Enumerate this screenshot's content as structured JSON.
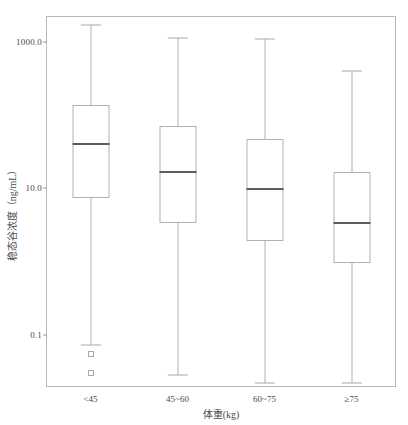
{
  "chart_data": {
    "type": "box",
    "title": "",
    "xlabel": "体重(kg)",
    "ylabel": "稳态谷浓度（ng/mL）",
    "y_scale": "log",
    "ylim": [
      0.02,
      2200
    ],
    "yticks": [
      0.1,
      10.0,
      1000.0
    ],
    "ytick_labels": [
      "0.1",
      "10.0",
      "1000.0"
    ],
    "grid": false,
    "legend": "none",
    "categories": [
      "<45",
      "45~60",
      "60~75",
      "≥75"
    ],
    "boxes": [
      {
        "category": "<45",
        "whisker_low": 0.073,
        "q1": 7.4,
        "median": 40.0,
        "q3": 140.0,
        "whisker_high": 1700.0,
        "outliers": [
          0.055,
          0.03
        ]
      },
      {
        "category": "45~60",
        "whisker_low": 0.028,
        "q1": 3.4,
        "median": 17.0,
        "q3": 72.0,
        "whisker_high": 1140.0,
        "outliers": []
      },
      {
        "category": "60~75",
        "whisker_low": 0.022,
        "q1": 1.9,
        "median": 9.7,
        "q3": 48.0,
        "whisker_high": 1090.0,
        "outliers": []
      },
      {
        "category": "≥75",
        "whisker_low": 0.022,
        "q1": 0.95,
        "median": 3.4,
        "q3": 17.0,
        "whisker_high": 400.0,
        "outliers": []
      }
    ],
    "colors": {
      "box_edge": "#b0b0b0",
      "median": "#5d5d5d",
      "whisker": "#b0b0b0",
      "frame": "#b9b9b9",
      "text": "#4a4a4a",
      "background": "#ffffff"
    }
  }
}
